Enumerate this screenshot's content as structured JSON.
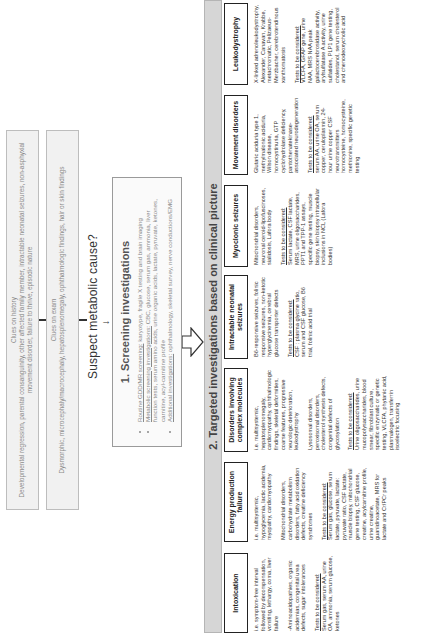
{
  "clues": {
    "history": {
      "title": "Clues on history",
      "text": "Developmental regression, parental consanguinity, other affected family member, intractable neonatal seizures, non-asphyxial movement disorder, failure to thrive, episodic nature"
    },
    "exam": {
      "title": "Clues on exam",
      "text": "Dysmorphic, microcephaly/macrocephaly, hepatosplenomegaly, ophthalmologic findings, hair or skin findings"
    }
  },
  "suspect": "Suspect metabolic cause?",
  "screening": {
    "title": "1.  Screening investigations",
    "items": [
      {
        "underlined": "Routine GDD/MR screening:",
        "text": " karyotype, fragile X testing and brain imaging"
      },
      {
        "underlined": "Metabolic screening investigations:",
        "text": " CBC, glucose, serum gas, ammonia, liver function tests, serum amino acids, urine organic acids, lactate, pyruvate, ketones, carnitine, acyl-carnitine profile"
      },
      {
        "underlined": "Additional investigations:",
        "text": " ophthalmology, skeletal survey, nerve conductions/EMG"
      }
    ]
  },
  "targeted": {
    "title": "2.  Targeted investigations based on clinical picture"
  },
  "tests_label": "Tests to be considered:",
  "columns": [
    {
      "header": "Intoxication",
      "paragraphs": [
        "i.e. symptom-free interval followed by decompensation, vomiting, lethargy, coma, liver failure",
        "-Aminoacidopathies, organic acidemias, congenital urea defects, sugar intolerances"
      ],
      "tests": "Serum gas, serum AA, urine OA, ammonia, serum glucose, ketones"
    },
    {
      "header": "Energy production failure",
      "paragraphs": [
        "i.e. multisystemic, hypoglycemia, lactic acidemia, myopathy, cardiomyopathy",
        "Mitochondrial disorders, carbohydrate metabolism disorders, fatty acid oxidation defects, creatine deficiency syndromes"
      ],
      "tests": "Serum gas, glucose, serum lactate, pyruvate, lactate: pyruvate ratio, CSF lactate, muscle biopsy, mitochondrial gene testing, CSF glucose, creatine, acylcarnitine profile, urine creatine, guanidinoacetate, MRS for lactate and Cr/PCr peaks"
    },
    {
      "header": "Disorders involving complex molecules",
      "paragraphs": [
        "i.e. multisystemic, hepatosplenomegaly, cardiomyopathy, ophthalmologic findings, skeletal deformities, coarse features, progressive neurologic deterioration, leukodystrophy",
        "Lysosomal disorders, peroxisomal disorders, cholesterol synthesis defects, congenital defects of glycosylation"
      ],
      "tests": "Urine oligosaccharides, urine mucopolysaccharides, blood smear, fibroblast culture, specific enzymatic or genetic testing, VLCFA, phytanic acid, plasmalogen, transferrin isoelectric focusing"
    },
    {
      "header": "Intractable neonatal seizures",
      "paragraphs": [
        "B6-responsive seizures, folinic responsive seizures, non-ketotic hyperglycinemia, cerebral glucose transporter defects"
      ],
      "tests": "CSF : plasma glycine ratio, serum and CSF glucose, B6 trial, folinic acid trial"
    },
    {
      "header": "Myoclonic seizures",
      "paragraphs": [
        "Mitochondrial disorders, neuronal ceroid-lipofuscinoses, sialidosis, Lafora body"
      ],
      "tests": "Serum lactate, CSF lactate, MRS, urine oligosaccharides, PPT1 and TPP-1 assays, specific gene testing, muscle biopsy, skin biopsy intracellular inclusions in NCL (Lafora bodies)"
    },
    {
      "header": "Movement disorders",
      "paragraphs": [
        "Glutaric aciduria type 1, methylmalonic aciduria, Wilson disease, homocystinuria, GTP cyclohydrolase deficiency, pantothenatekinase-associated neurodegeneration"
      ],
      "tests": "serum AA, urine OA, serum copper, ceruloplasmin, 24-hour urine copper CSF neurotransmitters homocysteine, homocysteine, methionine, specific genetic testing"
    },
    {
      "header": "Leukodystrophy",
      "paragraphs": [
        "X-linked adrenoleukodystrophy, Alexander, Canavan, Krabbe, metachromatic, Pelizaeus-Merzbacher, cerebrotendinous xanthomatosis"
      ],
      "tests": "VLCFA, GFAP gene, urine NAA, MRS NAA peak galactocerebrosidase activity, arylsulfatase A activity, urine sulfatides, PLP1 gene testing, cholestanol, serum cholesterol and chenodeoxycholic acid"
    }
  ],
  "colors": {
    "clue_bg": "#f1f1f1",
    "clue_text": "#8a8a8a",
    "bar_bg": "#d6d6d6",
    "header_border": "#222222"
  }
}
